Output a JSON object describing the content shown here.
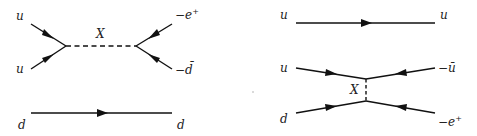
{
  "diagrams": {
    "left": {
      "labels": {
        "in_top": "u",
        "in_bottom": "u",
        "mediator": "X",
        "out_top": "−e",
        "out_top_sup": "+",
        "out_bottom": "−d̄",
        "spectator_in": "d",
        "spectator_out": "d"
      }
    },
    "right": {
      "labels": {
        "spectator_in": "u",
        "spectator_out": "u",
        "in_top": "u",
        "in_bottom": "d",
        "mediator": "X",
        "out_top": "−ū",
        "out_bottom": "−e",
        "out_bottom_sup": "+"
      }
    }
  },
  "colors": {
    "ink": "#111111",
    "background": "#ffffff"
  }
}
